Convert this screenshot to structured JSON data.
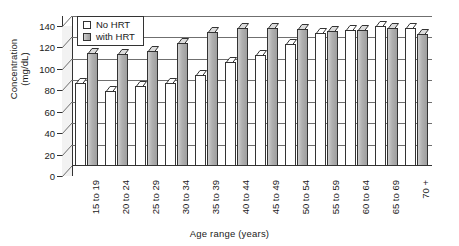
{
  "chart_data": {
    "type": "bar",
    "title": "",
    "xlabel": "Age range (years)",
    "ylabel_line1": "Concentration",
    "ylabel_line2": "(mg/dL)",
    "categories": [
      "15 to 19",
      "20 to 24",
      "25 to 29",
      "30 to 34",
      "35 to 39",
      "40 to 44",
      "45 to 49",
      "50 to 54",
      "55 to 59",
      "60 to 64",
      "65 to 69",
      "70 +"
    ],
    "series": [
      {
        "name": "No HRT",
        "color": "#ffffff",
        "values": [
          77,
          69,
          74,
          77,
          84,
          96,
          103,
          113,
          123,
          126,
          130,
          128
        ]
      },
      {
        "name": "with HRT",
        "color": "#b4b4b4",
        "values": [
          105,
          104,
          106,
          114,
          124,
          128,
          128,
          127,
          125,
          126,
          128,
          122
        ]
      }
    ],
    "ylim": [
      0,
      140
    ],
    "yticks": [
      0,
      20,
      40,
      60,
      80,
      100,
      120,
      140
    ],
    "grid": true,
    "legend_position": "top-left",
    "three_d": true
  }
}
